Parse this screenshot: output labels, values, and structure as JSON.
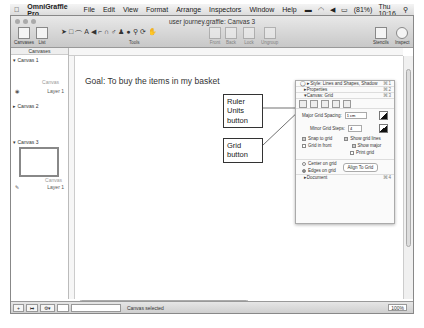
{
  "menubar": {
    "app": "OmniGraffle Pro",
    "items": [
      "File",
      "Edit",
      "View",
      "Format",
      "Arrange",
      "Inspectors",
      "Window",
      "Help"
    ],
    "battery": "(81%)",
    "clock": "Thu 10:16"
  },
  "window": {
    "title": "user journey.graffle: Canvas 3",
    "toolbar": {
      "canvases": "Canvases",
      "list": "List",
      "tools_label": "Tools",
      "front": "Front",
      "back": "Back",
      "lock": "Lock",
      "ungroup": "Ungroup",
      "stencils": "Stencils",
      "inspect": "Inspect"
    }
  },
  "sidebar": {
    "header": "Canvases",
    "canvases": [
      {
        "name": "Canvas 1",
        "thumb_label": "Canvas",
        "layer": "Layer 1"
      },
      {
        "name": "Canvas 2"
      },
      {
        "name": "Canvas 3",
        "thumb_label": "Canvas",
        "layer": "Layer 1"
      }
    ]
  },
  "canvas": {
    "goal": "Goal: To buy the items in my basket",
    "callouts": {
      "ruler": "Ruler Units button",
      "grid": "Grid button"
    }
  },
  "inspector": {
    "sections": [
      {
        "label": "Style: Lines and Shapes, Shadow",
        "shortcut": "⌘1"
      },
      {
        "label": "Properties",
        "shortcut": "⌘2"
      },
      {
        "label": "Canvas: Grid",
        "shortcut": "⌘3"
      }
    ],
    "major_label": "Major Grid Spacing:",
    "major_value": "1 cm",
    "minor_label": "Minor Grid Steps:",
    "minor_value": "4",
    "snap": "Snap to grid",
    "show_lines": "Show grid lines",
    "grid_front": "Grid in front",
    "show_major": "Show major",
    "print_grid": "Print grid",
    "center": "Center on grid",
    "edges": "Edges on grid",
    "align": "Align To Grid",
    "document": "Document",
    "document_shortcut": "⌘4"
  },
  "status": {
    "text": "Canvas selected",
    "zoom": "100%"
  }
}
